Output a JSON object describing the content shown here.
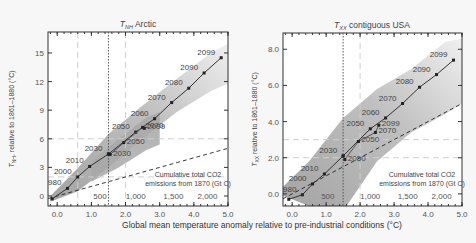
{
  "xlabel": "Global mean temperature anomaly relative to pre-industrial conditions (°C)",
  "chart_data": [
    {
      "type": "line",
      "title_var": "T",
      "title_sub": "NH",
      "title_text": "Arctic",
      "ylabel_var": "T",
      "ylabel_sub": "NH",
      "ylabel_text": ", relative to 1861–1880 (°C)",
      "xlim": [
        -0.27,
        5.0
      ],
      "ylim": [
        -1.05,
        17.2
      ],
      "xticks": [
        0.0,
        1.0,
        2.0,
        3.0,
        4.0,
        5.0
      ],
      "xtick_labels": [
        "0.0",
        "1.0",
        "2.0",
        "3.0",
        "4.0",
        "5.0"
      ],
      "yticks": [
        0,
        3,
        6,
        9,
        12,
        15
      ],
      "ytick_labels": [
        "0",
        "3",
        "6",
        "9",
        "12",
        "15"
      ],
      "vlines_dashed": [
        0.6,
        2.0
      ],
      "vline_dotted": 1.5,
      "hlines_dashed": [
        2.0,
        6.0
      ],
      "co2_axis": {
        "label_line1": "Cumulative total CO2",
        "label_line2": "emissions from 1870 (Gt C)",
        "ticks": [
          {
            "x": 1.25,
            "label": "500"
          },
          {
            "x": 2.3,
            "label": "1,000"
          },
          {
            "x": 3.4,
            "label": "1,500"
          },
          {
            "x": 4.4,
            "label": "2,000"
          }
        ]
      },
      "dashed_reference": [
        [
          -0.27,
          -0.27
        ],
        [
          5.0,
          5.0
        ]
      ],
      "series": [
        {
          "name": "historical-rcp85",
          "points": [
            {
              "x": -0.15,
              "y": -0.3,
              "label": "1890"
            },
            {
              "x": 0.3,
              "y": 0.8,
              "label": "1980"
            },
            {
              "x": 0.6,
              "y": 2.0,
              "label": "2000"
            },
            {
              "x": 0.95,
              "y": 3.1,
              "label": "2010"
            },
            {
              "x": 1.5,
              "y": 4.4,
              "label": "2030"
            },
            {
              "x": 2.3,
              "y": 6.7,
              "label": "2050"
            },
            {
              "x": 2.85,
              "y": 8.1,
              "label": "2060"
            },
            {
              "x": 3.35,
              "y": 9.8,
              "label": "2070"
            },
            {
              "x": 3.85,
              "y": 11.3,
              "label": "2080"
            },
            {
              "x": 4.3,
              "y": 12.9,
              "label": "2090"
            },
            {
              "x": 4.8,
              "y": 14.5,
              "label": "2099"
            }
          ]
        },
        {
          "name": "rcp45",
          "points": [
            {
              "x": 1.5,
              "y": 4.4,
              "label": ""
            },
            {
              "x": 1.55,
              "y": 4.35,
              "label": "2030"
            },
            {
              "x": 1.95,
              "y": 5.6,
              "label": "2050"
            },
            {
              "x": 2.5,
              "y": 7.2,
              "label": "2070"
            },
            {
              "x": 2.55,
              "y": 7.1,
              "label": "2099"
            }
          ]
        }
      ],
      "bands": [
        {
          "name": "rcp85-range",
          "upper": [
            [
              -0.2,
              0
            ],
            [
              0.6,
              2.9
            ],
            [
              1.5,
              6.5
            ],
            [
              2.5,
              9.5
            ],
            [
              3.5,
              12.3
            ],
            [
              4.5,
              15.0
            ],
            [
              5.0,
              16.0
            ]
          ],
          "lower": [
            [
              5.0,
              11.8
            ],
            [
              4.5,
              11.0
            ],
            [
              3.5,
              8.8
            ],
            [
              2.5,
              6.0
            ],
            [
              1.5,
              3.0
            ],
            [
              0.6,
              0.5
            ],
            [
              -0.2,
              -0.6
            ]
          ]
        },
        {
          "name": "rcp45-range",
          "upper": [
            [
              1.0,
              3.5
            ],
            [
              1.8,
              6.0
            ],
            [
              2.6,
              8.2
            ],
            [
              3.0,
              8.8
            ]
          ],
          "lower": [
            [
              3.0,
              5.4
            ],
            [
              2.6,
              4.8
            ],
            [
              1.8,
              3.0
            ],
            [
              1.0,
              1.5
            ]
          ]
        }
      ]
    },
    {
      "type": "line",
      "title_var": "T",
      "title_sub": "XX",
      "title_text": "contiguous USA",
      "ylabel_var": "T",
      "ylabel_sub": "XX",
      "ylabel_text": " relative to 1861–1880 (°C)",
      "xlim": [
        -0.27,
        5.0
      ],
      "ylim": [
        -0.67,
        8.9
      ],
      "xticks": [
        0.0,
        1.0,
        2.0,
        3.0,
        4.0,
        5.0
      ],
      "xtick_labels": [
        "0.0",
        "1.0",
        "2.0",
        "3.0",
        "4.0",
        "5.0"
      ],
      "yticks": [
        0.0,
        2.0,
        4.0,
        6.0,
        8.0
      ],
      "ytick_labels": [
        "0.0",
        "2.0",
        "4.0",
        "6.0",
        "8.0"
      ],
      "vlines_dashed": [
        2.0
      ],
      "vline_dotted": 1.5,
      "hlines_dashed": [
        2.0,
        3.0
      ],
      "co2_axis": {
        "label_line1": "Cumulative total CO2",
        "label_line2": "emissions from 1870 (Gt C)",
        "ticks": [
          {
            "x": 1.05,
            "label": "500"
          },
          {
            "x": 2.3,
            "label": "1,000"
          },
          {
            "x": 3.4,
            "label": "1,500"
          },
          {
            "x": 4.4,
            "label": "2,000"
          }
        ]
      },
      "dashed_reference": [
        [
          -0.27,
          -0.27
        ],
        [
          5.0,
          5.0
        ]
      ],
      "series": [
        {
          "name": "historical-rcp85",
          "points": [
            {
              "x": -0.1,
              "y": -0.3,
              "label": "1890"
            },
            {
              "x": 0.3,
              "y": -0.05,
              "label": "1980"
            },
            {
              "x": 0.6,
              "y": 0.55,
              "label": "2000"
            },
            {
              "x": 0.95,
              "y": 1.1,
              "label": "2010"
            },
            {
              "x": 1.5,
              "y": 2.1,
              "label": "2030"
            },
            {
              "x": 2.3,
              "y": 3.6,
              "label": "2050"
            },
            {
              "x": 2.75,
              "y": 4.2,
              "label": "2060"
            },
            {
              "x": 3.25,
              "y": 5.0,
              "label": "2070"
            },
            {
              "x": 3.75,
              "y": 5.9,
              "label": "2080"
            },
            {
              "x": 4.25,
              "y": 6.6,
              "label": "2090"
            },
            {
              "x": 4.75,
              "y": 7.4,
              "label": "2099"
            }
          ]
        },
        {
          "name": "rcp45",
          "points": [
            {
              "x": 1.5,
              "y": 2.1,
              "label": ""
            },
            {
              "x": 1.55,
              "y": 1.9,
              "label": "2050"
            },
            {
              "x": 1.95,
              "y": 2.9,
              "label": "2050"
            },
            {
              "x": 2.45,
              "y": 3.4,
              "label": "2070"
            },
            {
              "x": 2.55,
              "y": 3.8,
              "label": "2099"
            }
          ]
        }
      ],
      "bands": [
        {
          "name": "rcp85-range",
          "upper": [
            [
              -0.27,
              0.4
            ],
            [
              0.5,
              1.8
            ],
            [
              1.5,
              4.2
            ],
            [
              2.5,
              5.8
            ],
            [
              3.5,
              6.9
            ],
            [
              4.5,
              8.4
            ],
            [
              5.0,
              8.6
            ]
          ],
          "lower": [
            [
              5.0,
              5.0
            ],
            [
              4.5,
              4.4
            ],
            [
              3.5,
              3.4
            ],
            [
              2.5,
              1.8
            ],
            [
              1.6,
              -0.67
            ],
            [
              0.5,
              -0.67
            ],
            [
              -0.27,
              -0.1
            ]
          ]
        }
      ]
    }
  ]
}
